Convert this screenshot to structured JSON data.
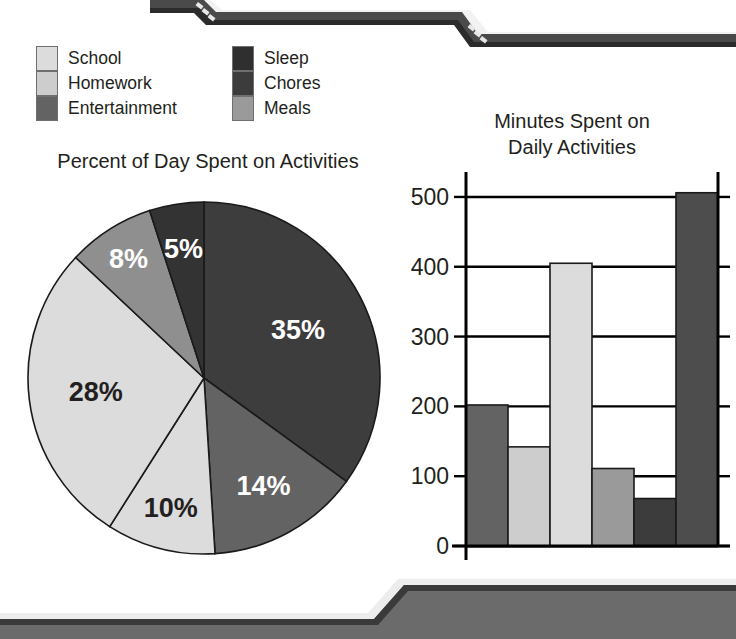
{
  "page": {
    "background": "#ffffff",
    "text_color": "#231f20"
  },
  "decorations": {
    "top_banner": {
      "name": "top-zigzag-banner",
      "dark": "#4a4a4a",
      "highlight": "#f2f2f2",
      "shadow": "#2b2b2b"
    },
    "bottom_banner": {
      "name": "bottom-zigzag-banner",
      "fill": "#6b6b6b",
      "highlight": "#ededed",
      "shadow": "#3a3a3a"
    }
  },
  "legend": {
    "left_column": [
      {
        "label": "School",
        "color": "#dcdcdc"
      },
      {
        "label": "Homework",
        "color": "#cdcdcd"
      },
      {
        "label": "Entertainment",
        "color": "#636363"
      }
    ],
    "right_column": [
      {
        "label": "Sleep",
        "color": "#2f2f2f"
      },
      {
        "label": "Chores",
        "color": "#3c3c3c"
      },
      {
        "label": "Meals",
        "color": "#9a9a9a"
      }
    ]
  },
  "chart_data": [
    {
      "type": "pie",
      "name": "percent-of-day-pie-chart",
      "title": "Percent of Day Spent on Activities",
      "start_angle_deg": 0,
      "direction": "clockwise",
      "categories": [
        "Sleep",
        "Entertainment",
        "Homework",
        "School",
        "Meals",
        "Chores"
      ],
      "values": [
        35,
        14,
        10,
        28,
        8,
        5
      ],
      "labels": [
        "35%",
        "14%",
        "10%",
        "28%",
        "8%",
        "5%"
      ],
      "label_colors": [
        "#ffffff",
        "#ffffff",
        "#231f20",
        "#231f20",
        "#ffffff",
        "#ffffff"
      ],
      "slice_colors": [
        "#3d3d3d",
        "#636363",
        "#dcdcdc",
        "#dcdcdc",
        "#8f8f8f",
        "#333333"
      ],
      "units": "percent",
      "legend_position": "top"
    },
    {
      "type": "bar",
      "name": "minutes-spent-bar-chart",
      "title": "Minutes Spent on Daily Activities",
      "title_line1": "Minutes Spent on",
      "title_line2": "Daily Activities",
      "categories": [
        "Entertainment",
        "Homework",
        "School",
        "Meals",
        "Chores",
        "Sleep"
      ],
      "values": [
        202,
        142,
        405,
        111,
        68,
        506
      ],
      "bar_colors": [
        "#636363",
        "#cdcdcd",
        "#dcdcdc",
        "#9a9a9a",
        "#3c3c3c",
        "#4d4d4d"
      ],
      "ylabel": "",
      "xlabel": "",
      "ylim": [
        0,
        530
      ],
      "yticks": [
        0,
        100,
        200,
        300,
        400,
        500
      ],
      "ytick_labels": [
        "0",
        "100",
        "200",
        "300",
        "400",
        "500"
      ],
      "grid": true,
      "grid_axis": "y",
      "x_tick_labels": []
    }
  ]
}
